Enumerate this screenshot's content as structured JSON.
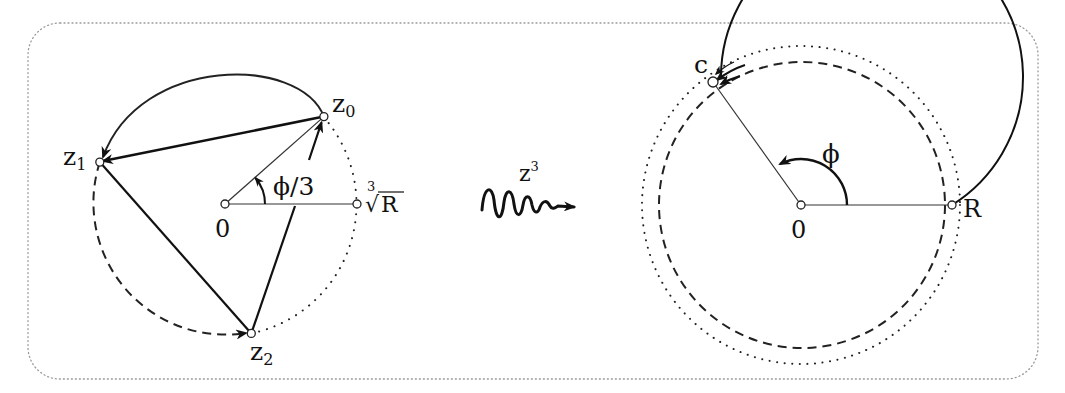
{
  "figure": {
    "frame": {
      "style": "dotted-rounded-border",
      "color": "#9a9a9a"
    },
    "left_panel": {
      "labels": {
        "origin": "0",
        "z0_base": "z",
        "z0_sub": "0",
        "z1_base": "z",
        "z1_sub": "1",
        "z2_base": "z",
        "z2_sub": "2",
        "angle": "ϕ/3",
        "cube_root_index": "3",
        "cube_root_radical": "√",
        "cube_root_arg": "R"
      },
      "description": "Three cube roots z0, z1, z2 on circle of radius cube-root of R, spaced 120 degrees apart; z0 at angle phi/3"
    },
    "map": {
      "label_base": "z",
      "label_exp": "3",
      "arrow_style": "wavy"
    },
    "right_panel": {
      "labels": {
        "origin": "0",
        "point_c": "c",
        "point_R": "R",
        "angle": "ϕ"
      },
      "description": "Image circle of radius R; point c at angle phi; solid, dashed and dotted arcs each wrapping once around to c"
    }
  }
}
